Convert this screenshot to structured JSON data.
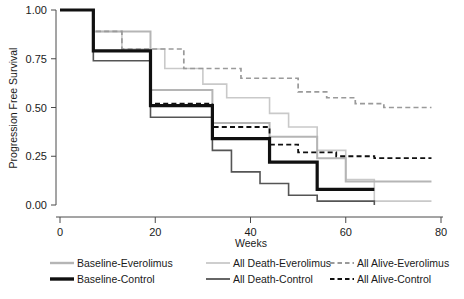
{
  "chart_data": {
    "type": "line",
    "title": "",
    "subtitle": "",
    "xlabel": "Weeks",
    "ylabel": "Progression Free Survival",
    "xlim": [
      0,
      80
    ],
    "ylim": [
      0.0,
      1.0
    ],
    "xticks": [
      0,
      20,
      40,
      60,
      80
    ],
    "xtick_labels": [
      "0",
      "20",
      "40",
      "60",
      "80"
    ],
    "yticks": [
      0.0,
      0.25,
      0.5,
      0.75,
      1.0
    ],
    "ytick_labels": [
      "0.00",
      "0.25",
      "0.50",
      "0.75",
      "1.00"
    ],
    "grid": false,
    "step_style": "post",
    "legend_position": "below",
    "annotations": [],
    "series": [
      {
        "name": "Baseline-Everolimus",
        "color": "#b5b5b5",
        "dash": "solid",
        "width": 2.0,
        "x": [
          0,
          7,
          13,
          19,
          26,
          32,
          38,
          44,
          48,
          54,
          60,
          66,
          78
        ],
        "y": [
          1.0,
          0.89,
          0.89,
          0.59,
          0.59,
          0.42,
          0.42,
          0.35,
          0.35,
          0.24,
          0.12,
          0.12,
          0.12
        ]
      },
      {
        "name": "Baseline-Control",
        "color": "#101010",
        "dash": "solid",
        "width": 3.2,
        "x": [
          0,
          7,
          13,
          19,
          26,
          32,
          38,
          44,
          48,
          54,
          60,
          66
        ],
        "y": [
          1.0,
          0.79,
          0.79,
          0.51,
          0.51,
          0.34,
          0.34,
          0.22,
          0.22,
          0.08,
          0.08,
          0.08
        ]
      },
      {
        "name": "All Death-Everolimus",
        "color": "#c9c9c9",
        "dash": "solid",
        "width": 1.6,
        "x": [
          0,
          7,
          13,
          19,
          22,
          26,
          30,
          35,
          40,
          44,
          48,
          54,
          60,
          66,
          78
        ],
        "y": [
          1.0,
          0.89,
          0.8,
          0.8,
          0.7,
          0.7,
          0.62,
          0.55,
          0.55,
          0.47,
          0.4,
          0.28,
          0.13,
          0.02,
          0.02
        ]
      },
      {
        "name": "All Death-Control",
        "color": "#555555",
        "dash": "solid",
        "width": 1.6,
        "x": [
          0,
          7,
          13,
          19,
          26,
          32,
          36,
          42,
          48,
          54,
          60,
          66
        ],
        "y": [
          1.0,
          0.74,
          0.74,
          0.45,
          0.45,
          0.28,
          0.17,
          0.11,
          0.05,
          0.02,
          0.02,
          0.0
        ]
      },
      {
        "name": "All Alive-Everolimus",
        "color": "#9a9a9a",
        "dash": "dashed",
        "width": 1.7,
        "x": [
          0,
          7,
          13,
          19,
          26,
          32,
          38,
          44,
          50,
          56,
          62,
          68,
          78
        ],
        "y": [
          1.0,
          0.89,
          0.8,
          0.8,
          0.7,
          0.7,
          0.65,
          0.65,
          0.58,
          0.55,
          0.52,
          0.5,
          0.5
        ]
      },
      {
        "name": "All Alive-Control",
        "color": "#101010",
        "dash": "dashed",
        "width": 1.8,
        "x": [
          0,
          7,
          13,
          19,
          26,
          32,
          38,
          44,
          50,
          58,
          66,
          78
        ],
        "y": [
          1.0,
          0.79,
          0.79,
          0.52,
          0.52,
          0.4,
          0.4,
          0.31,
          0.27,
          0.25,
          0.24,
          0.24
        ]
      }
    ]
  },
  "legend": {
    "entries": [
      {
        "label": "Baseline-Everolimus",
        "color": "#b5b5b5",
        "dash": "solid",
        "width": 2.4,
        "col": 0,
        "row": 0
      },
      {
        "label": "Baseline-Control",
        "color": "#101010",
        "dash": "solid",
        "width": 3.4,
        "col": 0,
        "row": 1
      },
      {
        "label": "All Death-Everolimus",
        "color": "#c9c9c9",
        "dash": "solid",
        "width": 1.8,
        "col": 1,
        "row": 0
      },
      {
        "label": "All Death-Control",
        "color": "#555555",
        "dash": "solid",
        "width": 1.8,
        "col": 1,
        "row": 1
      },
      {
        "label": "All Alive-Everolimus",
        "color": "#9a9a9a",
        "dash": "dashed",
        "width": 1.8,
        "col": 2,
        "row": 0
      },
      {
        "label": "All Alive-Control",
        "color": "#101010",
        "dash": "dashed",
        "width": 1.8,
        "col": 2,
        "row": 1
      }
    ]
  },
  "colors": {
    "axis": "#4a4a4a",
    "text": "#1a1a1a",
    "background": "#ffffff"
  }
}
